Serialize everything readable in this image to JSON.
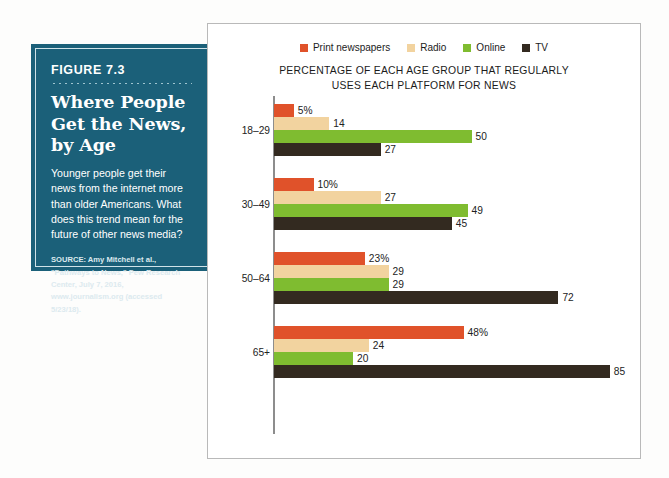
{
  "figure": {
    "number": "FIGURE 7.3",
    "title": "Where People Get the News, by Age",
    "description": "Younger people get their news from the internet more than older Americans. What does this trend mean for the future of other news media?",
    "source": "SOURCE: Amy Mitchell et al., \"Pathways to News,\" Pew Research Center, July 7, 2016, www.journalism.org (accessed 5/23/18).",
    "box_color": "#1b6079"
  },
  "chart_data": {
    "type": "bar",
    "orientation": "horizontal",
    "title": "PERCENTAGE OF EACH AGE GROUP THAT REGULARLY USES EACH PLATFORM FOR NEWS",
    "title_line1": "PERCENTAGE OF EACH AGE GROUP THAT REGULARLY",
    "title_line2": "USES EACH PLATFORM FOR NEWS",
    "xlabel": "",
    "ylabel": "",
    "categories": [
      "18–29",
      "30–49",
      "50–64",
      "65+"
    ],
    "legend_position": "top",
    "grid": false,
    "xlim": [
      0,
      85
    ],
    "series": [
      {
        "name": "Print newspapers",
        "color": "#e0522a",
        "values": [
          5,
          10,
          23,
          48
        ],
        "labels": [
          "5%",
          "10%",
          "23%",
          "48%"
        ]
      },
      {
        "name": "Radio",
        "color": "#f2d39f",
        "values": [
          14,
          27,
          29,
          24
        ],
        "labels": [
          "14",
          "27",
          "29",
          "24"
        ]
      },
      {
        "name": "Online",
        "color": "#7fbc30",
        "values": [
          50,
          49,
          29,
          20
        ],
        "labels": [
          "50",
          "49",
          "29",
          "20"
        ]
      },
      {
        "name": "TV",
        "color": "#332a20",
        "values": [
          27,
          45,
          72,
          85
        ],
        "labels": [
          "27",
          "45",
          "72",
          "85"
        ]
      }
    ]
  }
}
